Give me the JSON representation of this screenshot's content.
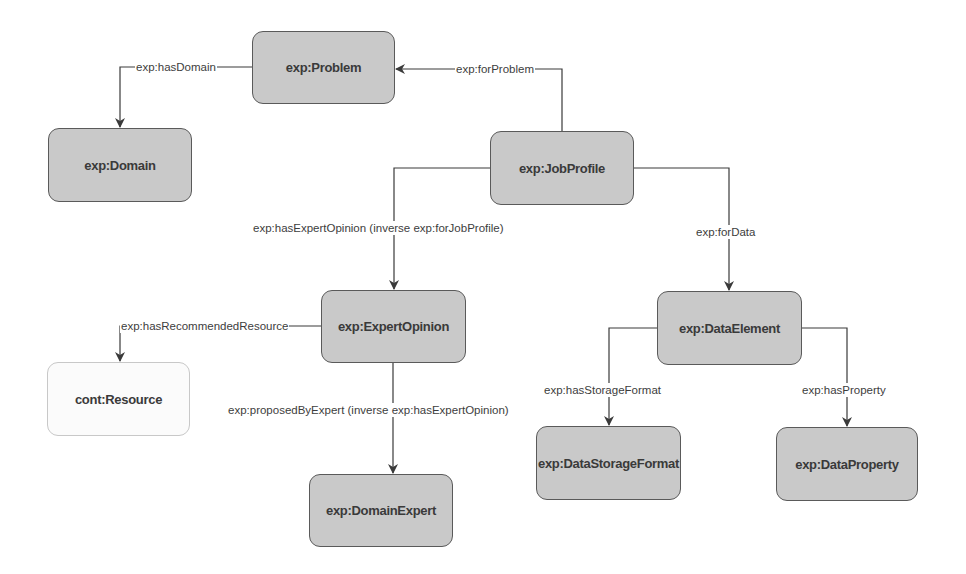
{
  "diagram": {
    "type": "ontology-class-diagram",
    "node_fill": "#c9c9c9",
    "external_node_fill": "#fbfbfb",
    "edge_color": "#3a3a3a",
    "nodes": {
      "problem": "exp:Problem",
      "domain": "exp:Domain",
      "job_profile": "exp:JobProfile",
      "expert_opinion": "exp:ExpertOpinion",
      "resource": "cont:Resource",
      "domain_expert": "exp:DomainExpert",
      "data_element": "exp:DataElement",
      "data_storage_format": "exp:DataStorageFormat",
      "data_property": "exp:DataProperty"
    },
    "edges": {
      "has_domain": {
        "label": "exp:hasDomain",
        "from": "exp:Problem",
        "to": "exp:Domain"
      },
      "for_problem": {
        "label": "exp:forProblem",
        "from": "exp:JobProfile",
        "to": "exp:Problem"
      },
      "has_expert_opinion": {
        "label": "exp:hasExpertOpinion (inverse exp:forJobProfile)",
        "from": "exp:JobProfile",
        "to": "exp:ExpertOpinion"
      },
      "for_data": {
        "label": "exp:forData",
        "from": "exp:JobProfile",
        "to": "exp:DataElement"
      },
      "has_recommended_resource": {
        "label": "exp:hasRecommendedResource",
        "from": "exp:ExpertOpinion",
        "to": "cont:Resource"
      },
      "proposed_by_expert": {
        "label": "exp:proposedByExpert (inverse exp:hasExpertOpinion)",
        "from": "exp:ExpertOpinion",
        "to": "exp:DomainExpert"
      },
      "has_storage_format": {
        "label": "exp:hasStorageFormat",
        "from": "exp:DataElement",
        "to": "exp:DataStorageFormat"
      },
      "has_property": {
        "label": "exp:hasProperty",
        "from": "exp:DataElement",
        "to": "exp:DataProperty"
      }
    }
  }
}
